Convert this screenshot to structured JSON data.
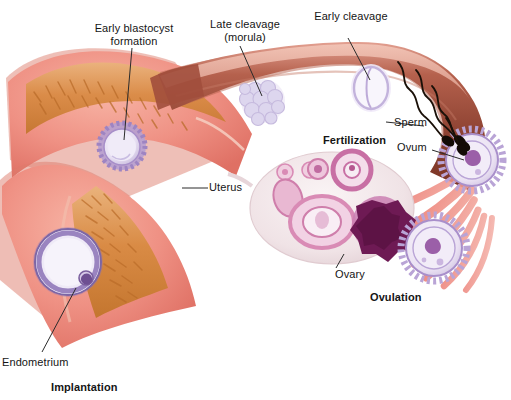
{
  "figure": {
    "type": "medical-illustration"
  },
  "labels": {
    "early_blastocyst": "Early blastocyst\nformation",
    "late_cleavage": "Late cleavage\n(morula)",
    "early_cleavage": "Early cleavage",
    "sperm": "Sperm",
    "ovum": "Ovum",
    "fertilization": "Fertilization",
    "uterus": "Uterus",
    "ovary": "Ovary",
    "ovulation": "Ovulation",
    "endometrium": "Endometrium",
    "implantation": "Implantation"
  },
  "colors": {
    "background": "#ffffff",
    "text": "#151515",
    "leader_line": "#2b2b2b",
    "myometrium_pink": "#eb8a7e",
    "myometrium_light": "#f3a89a",
    "endometrium_orange": "#d98b4a",
    "endometrium_light": "#e8b07a",
    "tube_dark": "#8d4232",
    "tube_mid": "#a85442",
    "tube_light": "#d98d7c",
    "ovary_pale": "#f1e6e8",
    "follicle_pink": "#d98bb5",
    "follicle_dark": "#7d1f5e",
    "embryo_lavender": "#c9bede",
    "embryo_pale": "#ece6f4",
    "fimbriae_red": "#e0564b",
    "sperm_dark": "#1a1008"
  },
  "structures": [
    {
      "name": "uterus",
      "description": "Muscular uterine body with villous endometrial lining"
    },
    {
      "name": "fallopian-tube",
      "description": "Uterine tube connecting uterus to ovary"
    },
    {
      "name": "ovary",
      "description": "Ovary containing follicles at progressive maturation stages"
    },
    {
      "name": "fimbriae",
      "description": "Finger-like projections at the tube's distal end"
    },
    {
      "name": "endometrium",
      "description": "Inner uterine lining where implantation occurs"
    }
  ],
  "stages": [
    {
      "order": 1,
      "name": "ovulation",
      "label": "Ovulation",
      "description": "Mature ovum released from ovary"
    },
    {
      "order": 2,
      "name": "fertilization",
      "label": "Fertilization",
      "description": "Sperm penetrates ovum in the tube"
    },
    {
      "order": 3,
      "name": "early-cleavage",
      "label": "Early cleavage",
      "description": "Two-cell zygote"
    },
    {
      "order": 4,
      "name": "late-cleavage",
      "label": "Late cleavage (morula)",
      "description": "Solid ball of cells"
    },
    {
      "order": 5,
      "name": "early-blastocyst",
      "label": "Early blastocyst formation",
      "description": "Fluid-filled cavity forms"
    },
    {
      "order": 6,
      "name": "implantation",
      "label": "Implantation",
      "description": "Blastocyst embeds in endometrium"
    }
  ],
  "ovary_follicles": [
    {
      "stage": "primordial",
      "count": 2,
      "tone": "pale-pink"
    },
    {
      "stage": "primary",
      "count": 1,
      "tone": "pink"
    },
    {
      "stage": "secondary",
      "count": 1,
      "tone": "pink-ring"
    },
    {
      "stage": "antral",
      "count": 1,
      "tone": "light-pink"
    },
    {
      "stage": "mature-graafian",
      "count": 1,
      "tone": "light-pink-large"
    },
    {
      "stage": "corpus-luteum",
      "count": 1,
      "tone": "deep-magenta"
    }
  ],
  "sperm_count": 3
}
